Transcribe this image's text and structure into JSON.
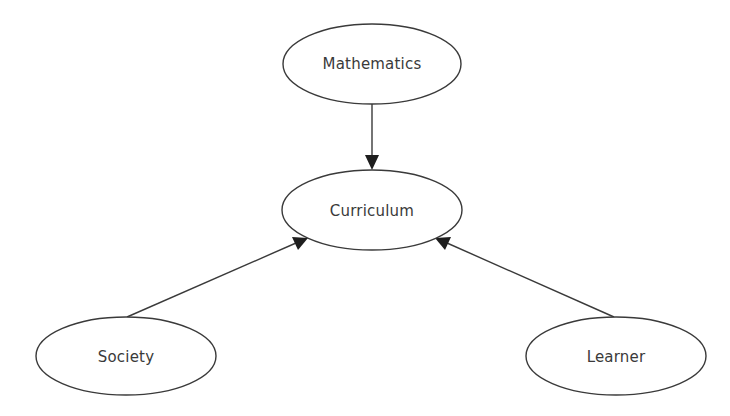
{
  "diagram": {
    "type": "concept-map",
    "nodes": [
      {
        "id": "mathematics",
        "label": "Mathematics",
        "cx": 372,
        "cy": 64,
        "rx": 89,
        "ry": 40
      },
      {
        "id": "curriculum",
        "label": "Curriculum",
        "cx": 372,
        "cy": 210,
        "rx": 90,
        "ry": 40
      },
      {
        "id": "society",
        "label": "Society",
        "cx": 126,
        "cy": 356,
        "rx": 90,
        "ry": 39
      },
      {
        "id": "learner",
        "label": "Learner",
        "cx": 616,
        "cy": 356,
        "rx": 90,
        "ry": 39
      }
    ],
    "edges": [
      {
        "from": "mathematics",
        "to": "curriculum"
      },
      {
        "from": "society",
        "to": "curriculum"
      },
      {
        "from": "learner",
        "to": "curriculum"
      }
    ],
    "colors": {
      "stroke": "#3a3a3a",
      "arrowhead": "#1e1e1e",
      "background": "#ffffff"
    }
  }
}
